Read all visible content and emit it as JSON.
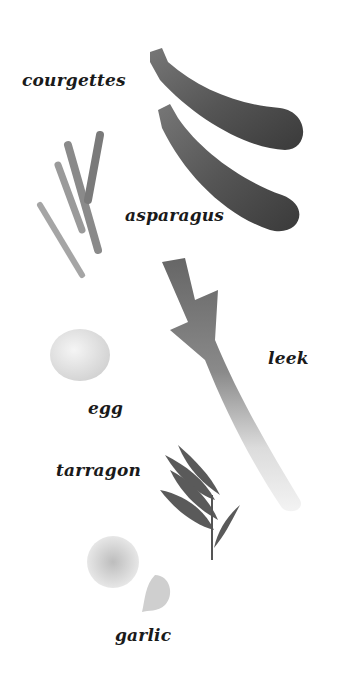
{
  "labels": {
    "courgettes": "courgettes",
    "asparagus": "asparagus",
    "leek": "leek",
    "egg": "egg",
    "tarragon": "tarragon",
    "garlic": "garlic"
  },
  "colors": {
    "background": "#ffffff",
    "text": "#1a1a1a"
  }
}
